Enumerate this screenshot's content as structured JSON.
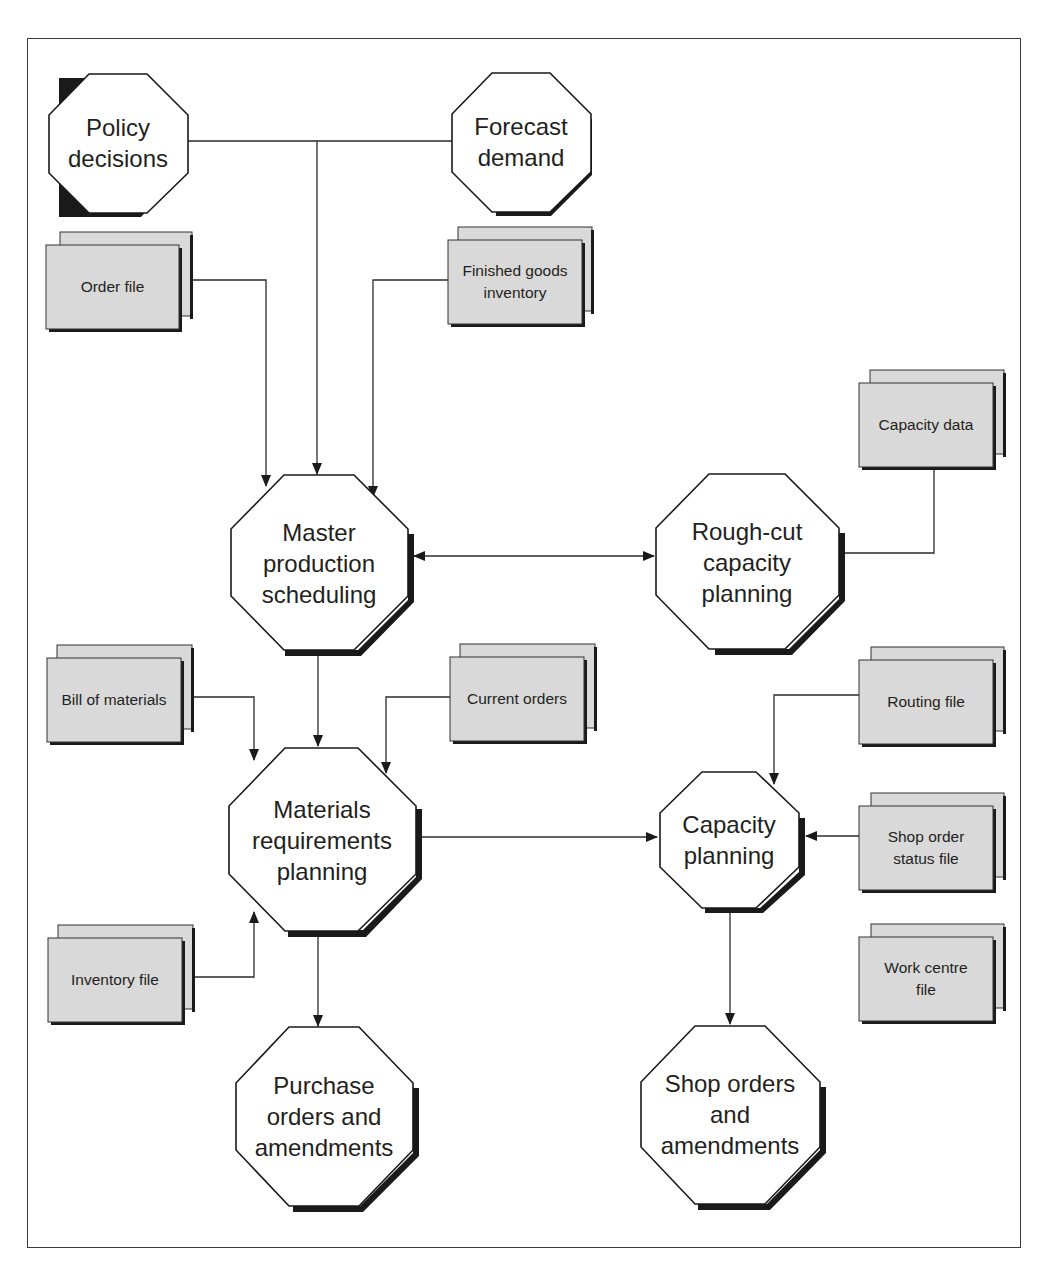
{
  "diagram": {
    "title": "",
    "type": "flowchart",
    "processes": [
      {
        "id": "policy",
        "label": "Policy\ndecisions"
      },
      {
        "id": "forecast",
        "label": "Forecast\ndemand"
      },
      {
        "id": "mps",
        "label": "Master\nproduction\nscheduling"
      },
      {
        "id": "rccp",
        "label": "Rough-cut\ncapacity\nplanning"
      },
      {
        "id": "mrp",
        "label": "Materials\nrequirements\nplanning"
      },
      {
        "id": "cp",
        "label": "Capacity\nplanning"
      },
      {
        "id": "po",
        "label": "Purchase\norders and\namendments"
      },
      {
        "id": "so",
        "label": "Shop orders\nand\namendments"
      }
    ],
    "files": [
      {
        "id": "order_file",
        "label": "Order file"
      },
      {
        "id": "fg_inventory",
        "label": "Finished goods\ninventory"
      },
      {
        "id": "capacity_data",
        "label": "Capacity data"
      },
      {
        "id": "bom",
        "label": "Bill of materials"
      },
      {
        "id": "current_orders",
        "label": "Current orders"
      },
      {
        "id": "routing_file",
        "label": "Routing file"
      },
      {
        "id": "shop_order_status",
        "label": "Shop order\nstatus file"
      },
      {
        "id": "inventory_file",
        "label": "Inventory file"
      },
      {
        "id": "work_centre_file",
        "label": "Work centre\nfile"
      }
    ],
    "edges": [
      {
        "from": "policy",
        "to": "mps"
      },
      {
        "from": "forecast",
        "to": "mps"
      },
      {
        "from": "order_file",
        "to": "mps"
      },
      {
        "from": "fg_inventory",
        "to": "mps"
      },
      {
        "from": "mps",
        "to": "rccp",
        "bidirectional": true
      },
      {
        "from": "capacity_data",
        "to": "rccp"
      },
      {
        "from": "mps",
        "to": "mrp"
      },
      {
        "from": "bom",
        "to": "mrp"
      },
      {
        "from": "current_orders",
        "to": "mrp"
      },
      {
        "from": "inventory_file",
        "to": "mrp"
      },
      {
        "from": "mrp",
        "to": "cp"
      },
      {
        "from": "routing_file",
        "to": "cp"
      },
      {
        "from": "shop_order_status",
        "to": "cp"
      },
      {
        "from": "mrp",
        "to": "po"
      },
      {
        "from": "cp",
        "to": "so"
      }
    ]
  },
  "colors": {
    "line": "#2b2b2b",
    "shadow": "#1a1a1a",
    "file_fill": "#d9d9d9",
    "octagon_fill": "#ffffff"
  }
}
